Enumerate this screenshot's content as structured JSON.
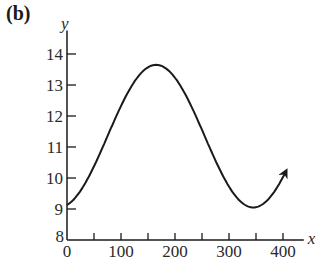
{
  "panel_label": "(b)",
  "chart_data": {
    "type": "line",
    "title": "",
    "xlabel": "x",
    "ylabel": "y",
    "xlim": [
      0,
      420
    ],
    "ylim": [
      8,
      14.5
    ],
    "x_ticks": [
      0,
      50,
      100,
      150,
      200,
      250,
      300,
      350,
      400
    ],
    "x_tick_labels": [
      "0",
      "100",
      "200",
      "300",
      "400"
    ],
    "y_ticks": [
      8,
      9,
      10,
      11,
      12,
      13,
      14
    ],
    "y_tick_labels": [
      "8",
      "9",
      "10",
      "11",
      "12",
      "13",
      "14"
    ],
    "grid": false,
    "legend": null,
    "series": [
      {
        "name": "y(x)",
        "end_arrow": true,
        "x": [
          0,
          25,
          50,
          75,
          100,
          125,
          150,
          165,
          175,
          200,
          225,
          250,
          275,
          300,
          325,
          345,
          365,
          385,
          405
        ],
        "y": [
          9.13,
          9.27,
          9.55,
          9.95,
          10.43,
          10.99,
          11.54,
          13.65,
          13.63,
          13.46,
          13.07,
          12.52,
          11.88,
          11.22,
          10.59,
          9.05,
          9.12,
          9.48,
          10.2
        ]
      }
    ],
    "annotations": [
      "arrowhead at end of curve near x=405, y=10.2"
    ],
    "key_points": {
      "start": {
        "x": 0,
        "y": 9.1
      },
      "maximum": {
        "x": 165,
        "y": 13.65
      },
      "minimum": {
        "x": 345,
        "y": 9.05
      }
    }
  }
}
